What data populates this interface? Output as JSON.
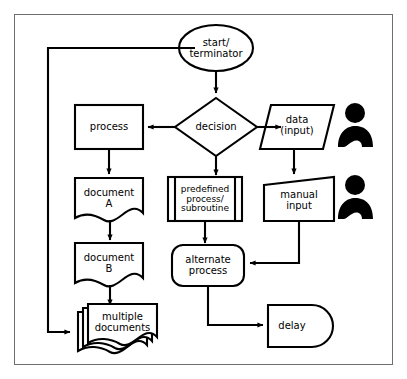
{
  "diagram": {
    "background_color": "#ffffff",
    "stroke_color": "#000000",
    "frame_color": "#6e6e6e",
    "nodes": [
      {
        "id": "start",
        "label": "start/\nterminator",
        "shape": "ellipse"
      },
      {
        "id": "decision",
        "label": "decision",
        "shape": "diamond"
      },
      {
        "id": "process",
        "label": "process",
        "shape": "rectangle"
      },
      {
        "id": "data",
        "label": "data\n(input)",
        "shape": "parallelogram"
      },
      {
        "id": "docA",
        "label": "document\nA",
        "shape": "document"
      },
      {
        "id": "predef",
        "label": "predefined\nprocess/\nsubroutine",
        "shape": "predefined-process"
      },
      {
        "id": "manual",
        "label": "manual\ninput",
        "shape": "manual-input"
      },
      {
        "id": "docB",
        "label": "document\nB",
        "shape": "document"
      },
      {
        "id": "alternate",
        "label": "alternate\nprocess",
        "shape": "rounded-rectangle"
      },
      {
        "id": "multidoc",
        "label": "multiple\ndocuments",
        "shape": "multi-document"
      },
      {
        "id": "delay",
        "label": "delay",
        "shape": "delay"
      }
    ],
    "icons": [
      {
        "id": "person-data",
        "name": "person-icon"
      },
      {
        "id": "person-manual",
        "name": "person-icon"
      }
    ],
    "edges": [
      {
        "from": "start",
        "to": "decision",
        "style": "straight-down"
      },
      {
        "from": "decision",
        "to": "process",
        "style": "straight-left"
      },
      {
        "from": "decision",
        "to": "data",
        "style": "straight-right"
      },
      {
        "from": "decision",
        "to": "predef",
        "style": "straight-down"
      },
      {
        "from": "process",
        "to": "docA",
        "style": "straight-down"
      },
      {
        "from": "data",
        "to": "manual",
        "style": "straight-down"
      },
      {
        "from": "docA",
        "to": "docB",
        "style": "straight-down"
      },
      {
        "from": "predef",
        "to": "alternate",
        "style": "straight-down"
      },
      {
        "from": "docB",
        "to": "multidoc",
        "style": "straight-down"
      },
      {
        "from": "manual",
        "to": "alternate",
        "style": "down-then-left"
      },
      {
        "from": "alternate",
        "to": "delay",
        "style": "down-then-right"
      },
      {
        "from": "start",
        "to": "multidoc",
        "style": "left-down-right-loop"
      }
    ]
  }
}
